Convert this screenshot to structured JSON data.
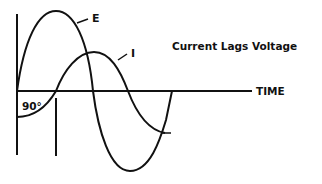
{
  "diagram": {
    "title": "Current Lags Voltage",
    "axis_label": "TIME",
    "phase_label": "90°",
    "curves": [
      {
        "name": "E",
        "label": "E",
        "description": "Voltage waveform"
      },
      {
        "name": "I",
        "label": "I",
        "description": "Current waveform"
      }
    ],
    "colors": {
      "line": "#111111",
      "background": "#ffffff"
    }
  }
}
